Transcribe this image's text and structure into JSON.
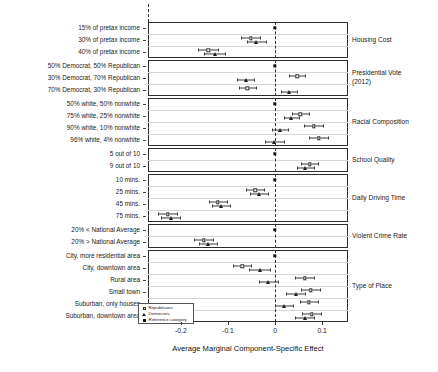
{
  "chart_data": {
    "type": "scatter",
    "title": "",
    "xlabel": "Average Marginal Component-Specific Effect",
    "ylabel": "",
    "xlim": [
      -0.27,
      0.155
    ],
    "xticks": [
      -0.2,
      -0.1,
      0,
      0.1
    ],
    "xticklabels": [
      "-0.2",
      "-0.1",
      "0",
      "0.1"
    ],
    "grid": true,
    "zero_reference_line": 0,
    "legend_position": "bottom-left",
    "legend": [
      {
        "name": "Republicans",
        "marker": "open-square"
      },
      {
        "name": "Democrats",
        "marker": "triangle"
      },
      {
        "name": "Reference category",
        "marker": "filled-square"
      }
    ],
    "groups": [
      {
        "name": "Housing Cost",
        "levels": [
          {
            "label": "15% of pretax income",
            "reference": true,
            "series": [
              {
                "name": "Reference category",
                "value": 0.0
              }
            ]
          },
          {
            "label": "30% of pretax income",
            "reference": false,
            "series": [
              {
                "name": "Republicans",
                "value": -0.052,
                "lo": -0.072,
                "hi": -0.032
              },
              {
                "name": "Democrats",
                "value": -0.04,
                "lo": -0.06,
                "hi": -0.02
              }
            ]
          },
          {
            "label": "40% of pretax income",
            "reference": false,
            "series": [
              {
                "name": "Republicans",
                "value": -0.142,
                "lo": -0.163,
                "hi": -0.121
              },
              {
                "name": "Democrats",
                "value": -0.128,
                "lo": -0.15,
                "hi": -0.106
              }
            ]
          }
        ]
      },
      {
        "name": "Presidential Vote\n(2012)",
        "levels": [
          {
            "label": "50% Democrat, 50% Republican",
            "reference": true,
            "series": [
              {
                "name": "Reference category",
                "value": 0.0
              }
            ]
          },
          {
            "label": "30% Democrat, 70% Republican",
            "reference": false,
            "series": [
              {
                "name": "Republicans",
                "value": 0.047,
                "lo": 0.03,
                "hi": 0.064
              },
              {
                "name": "Democrats",
                "value": -0.062,
                "lo": -0.08,
                "hi": -0.044
              }
            ]
          },
          {
            "label": "70% Democrat, 30% Republican",
            "reference": false,
            "series": [
              {
                "name": "Republicans",
                "value": -0.059,
                "lo": -0.077,
                "hi": -0.041
              },
              {
                "name": "Democrats",
                "value": 0.029,
                "lo": 0.012,
                "hi": 0.046
              }
            ]
          }
        ]
      },
      {
        "name": "Racial Composition",
        "levels": [
          {
            "label": "50% white, 50% nonwhite",
            "reference": true,
            "series": [
              {
                "name": "Reference category",
                "value": 0.0
              }
            ]
          },
          {
            "label": "75% white, 25% nonwhite",
            "reference": false,
            "series": [
              {
                "name": "Republicans",
                "value": 0.054,
                "lo": 0.036,
                "hi": 0.072
              },
              {
                "name": "Democrats",
                "value": 0.034,
                "lo": 0.018,
                "hi": 0.05
              }
            ]
          },
          {
            "label": "90% white, 10% nonwhite",
            "reference": false,
            "series": [
              {
                "name": "Republicans",
                "value": 0.082,
                "lo": 0.062,
                "hi": 0.102
              },
              {
                "name": "Democrats",
                "value": 0.011,
                "lo": -0.006,
                "hi": 0.028
              }
            ]
          },
          {
            "label": "96% white, 4% nonwhite",
            "reference": false,
            "series": [
              {
                "name": "Republicans",
                "value": 0.093,
                "lo": 0.073,
                "hi": 0.113
              },
              {
                "name": "Democrats",
                "value": -0.002,
                "lo": -0.022,
                "hi": 0.018
              }
            ]
          }
        ]
      },
      {
        "name": "School Quality",
        "levels": [
          {
            "label": "5 out of 10",
            "reference": true,
            "series": [
              {
                "name": "Reference category",
                "value": 0.0
              }
            ]
          },
          {
            "label": "9 out of 10",
            "reference": false,
            "series": [
              {
                "name": "Republicans",
                "value": 0.074,
                "lo": 0.056,
                "hi": 0.092
              },
              {
                "name": "Democrats",
                "value": 0.064,
                "lo": 0.046,
                "hi": 0.082
              }
            ]
          }
        ]
      },
      {
        "name": "Daily Driving Time",
        "levels": [
          {
            "label": "10 mins.",
            "reference": true,
            "series": [
              {
                "name": "Reference category",
                "value": 0.0
              }
            ]
          },
          {
            "label": "25 mins.",
            "reference": false,
            "series": [
              {
                "name": "Republicans",
                "value": -0.042,
                "lo": -0.061,
                "hi": -0.023
              },
              {
                "name": "Democrats",
                "value": -0.034,
                "lo": -0.053,
                "hi": -0.015
              }
            ]
          },
          {
            "label": "45 mins.",
            "reference": false,
            "series": [
              {
                "name": "Republicans",
                "value": -0.122,
                "lo": -0.141,
                "hi": -0.103
              },
              {
                "name": "Democrats",
                "value": -0.114,
                "lo": -0.133,
                "hi": -0.095
              }
            ]
          },
          {
            "label": "75 mins.",
            "reference": false,
            "series": [
              {
                "name": "Republicans",
                "value": -0.228,
                "lo": -0.248,
                "hi": -0.208
              },
              {
                "name": "Democrats",
                "value": -0.222,
                "lo": -0.242,
                "hi": -0.202
              }
            ]
          }
        ]
      },
      {
        "name": "Violent Crime Rate",
        "levels": [
          {
            "label": "20% < National Average",
            "reference": true,
            "series": [
              {
                "name": "Reference category",
                "value": 0.0
              }
            ]
          },
          {
            "label": "20% > National Average",
            "reference": false,
            "series": [
              {
                "name": "Republicans",
                "value": -0.152,
                "lo": -0.172,
                "hi": -0.132
              },
              {
                "name": "Democrats",
                "value": -0.142,
                "lo": -0.161,
                "hi": -0.123
              }
            ]
          }
        ]
      },
      {
        "name": "Type of Place",
        "levels": [
          {
            "label": "City, more residential area",
            "reference": true,
            "series": [
              {
                "name": "Reference category",
                "value": 0.0
              }
            ]
          },
          {
            "label": "City, downtown area",
            "reference": false,
            "series": [
              {
                "name": "Republicans",
                "value": -0.07,
                "lo": -0.089,
                "hi": -0.051
              },
              {
                "name": "Democrats",
                "value": -0.033,
                "lo": -0.055,
                "hi": -0.011
              }
            ]
          },
          {
            "label": "Rural area",
            "reference": false,
            "series": [
              {
                "name": "Republicans",
                "value": 0.063,
                "lo": 0.043,
                "hi": 0.083
              },
              {
                "name": "Democrats",
                "value": -0.014,
                "lo": -0.035,
                "hi": 0.007
              }
            ]
          },
          {
            "label": "Small town",
            "reference": false,
            "series": [
              {
                "name": "Republicans",
                "value": 0.076,
                "lo": 0.056,
                "hi": 0.096
              },
              {
                "name": "Democrats",
                "value": 0.044,
                "lo": 0.024,
                "hi": 0.064
              }
            ]
          },
          {
            "label": "Suburban, only houses",
            "reference": false,
            "series": [
              {
                "name": "Republicans",
                "value": 0.072,
                "lo": 0.052,
                "hi": 0.092
              },
              {
                "name": "Democrats",
                "value": 0.019,
                "lo": -0.001,
                "hi": 0.039
              }
            ]
          },
          {
            "label": "Suburban, downtown area",
            "reference": false,
            "series": [
              {
                "name": "Republicans",
                "value": 0.078,
                "lo": 0.058,
                "hi": 0.098
              },
              {
                "name": "Democrats",
                "value": 0.063,
                "lo": 0.043,
                "hi": 0.083
              }
            ]
          }
        ]
      }
    ]
  }
}
